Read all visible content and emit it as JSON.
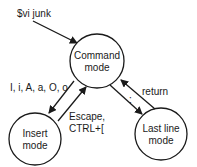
{
  "diagram": {
    "colors": {
      "stroke": "#1a1a1a",
      "background": "#ffffff",
      "text": "#1a1a1a"
    },
    "start": {
      "label": "$vi junk"
    },
    "nodes": [
      {
        "id": "command",
        "line1": "Command",
        "line2": "mode"
      },
      {
        "id": "insert",
        "line1": "Insert",
        "line2": "mode"
      },
      {
        "id": "lastline",
        "line1": "Last line",
        "line2": "mode"
      }
    ],
    "edges": [
      {
        "from": "start",
        "to": "command",
        "label": ""
      },
      {
        "from": "command",
        "to": "insert",
        "label": "I, i, A, a, O, o"
      },
      {
        "from": "insert",
        "to": "command",
        "label_line1": "Escape,",
        "label_line2": "CTRL+["
      },
      {
        "from": "command",
        "to": "lastline",
        "label": ":"
      },
      {
        "from": "lastline",
        "to": "command",
        "label": "return"
      }
    ]
  }
}
